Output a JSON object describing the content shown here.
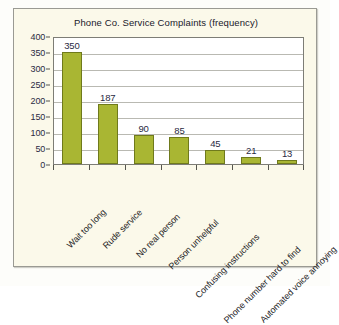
{
  "chart_data": {
    "type": "bar",
    "title": "Phone Co. Service Complaints (frequency)",
    "xlabel": "",
    "ylabel": "",
    "ylim": [
      0,
      400
    ],
    "ytick_step": 50,
    "yticks": [
      400,
      350,
      300,
      250,
      200,
      150,
      100,
      50,
      0
    ],
    "grid": true,
    "legend": "none",
    "categories": [
      "Wait too long",
      "Rude service",
      "No real person",
      "Person unhelpful",
      "Confusing instructions",
      "Phone number hard to find",
      "Automated voice annoying"
    ],
    "values": [
      350,
      187,
      90,
      85,
      45,
      21,
      13
    ],
    "value_labels": [
      "350",
      "187",
      "90",
      "85",
      "45",
      "21",
      "13"
    ],
    "bar_color": "#a9b633",
    "bar_border_color": "#6f7a1c",
    "panel_color": "#fbf9ea",
    "plot_background": "#ffffff",
    "gridline_color": "#b9b9b2",
    "axis_color": "#55554e",
    "label_color": "#1d1d26",
    "value_label_color": "#2a2a42"
  }
}
